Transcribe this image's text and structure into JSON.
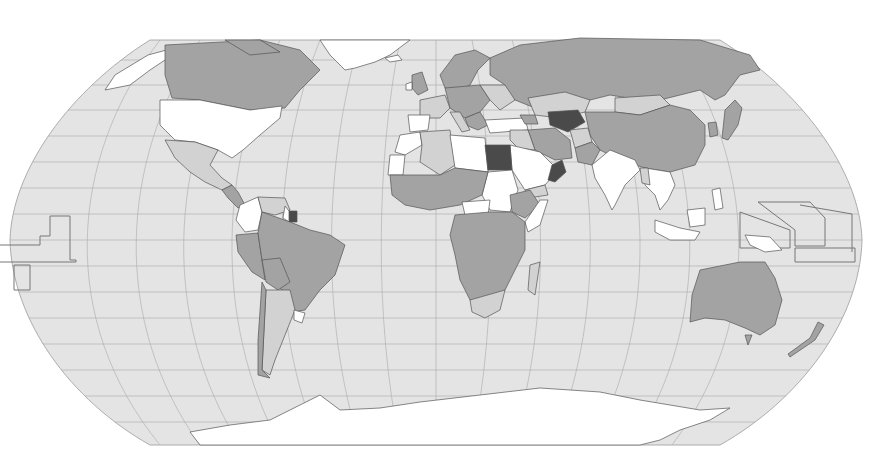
{
  "map": {
    "type": "choropleth",
    "projection": "Robinson",
    "labels_visible": false,
    "legend_visible": false,
    "colors": {
      "background": "#ffffff",
      "ocean": "#e4e4e4",
      "graticule": "#a9a9a9",
      "border": "#555555",
      "shade_none": "#ffffff",
      "shade_1": "#d2d2d2",
      "shade_2": "#a3a3a3",
      "shade_3": "#4a4a4a"
    },
    "regions": [
      {
        "name": "Canada",
        "shade": "shade_2"
      },
      {
        "name": "United States",
        "shade": "shade_none"
      },
      {
        "name": "Mexico",
        "shade": "shade_1"
      },
      {
        "name": "Greenland",
        "shade": "shade_none"
      },
      {
        "name": "Brazil",
        "shade": "shade_2"
      },
      {
        "name": "Argentina",
        "shade": "shade_1"
      },
      {
        "name": "Chile",
        "shade": "shade_2"
      },
      {
        "name": "Peru",
        "shade": "shade_2"
      },
      {
        "name": "Colombia",
        "shade": "shade_none"
      },
      {
        "name": "Venezuela",
        "shade": "shade_1"
      },
      {
        "name": "Suriname",
        "shade": "shade_3"
      },
      {
        "name": "Uruguay",
        "shade": "shade_none"
      },
      {
        "name": "Russia",
        "shade": "shade_2"
      },
      {
        "name": "China",
        "shade": "shade_2"
      },
      {
        "name": "Mongolia",
        "shade": "shade_1"
      },
      {
        "name": "Kazakhstan",
        "shade": "shade_1"
      },
      {
        "name": "Turkmenistan/Uzbekistan",
        "shade": "shade_3"
      },
      {
        "name": "India",
        "shade": "shade_none"
      },
      {
        "name": "Iran",
        "shade": "shade_2"
      },
      {
        "name": "Pakistan",
        "shade": "shade_2"
      },
      {
        "name": "Afghanistan",
        "shade": "shade_1"
      },
      {
        "name": "Saudi Arabia",
        "shade": "shade_none"
      },
      {
        "name": "Oman",
        "shade": "shade_3"
      },
      {
        "name": "Egypt",
        "shade": "shade_3"
      },
      {
        "name": "Libya",
        "shade": "shade_none"
      },
      {
        "name": "Algeria",
        "shade": "shade_1"
      },
      {
        "name": "Sudan",
        "shade": "shade_none"
      },
      {
        "name": "Ethiopia",
        "shade": "shade_2"
      },
      {
        "name": "Sub-Saharan Africa",
        "shade": "shade_2"
      },
      {
        "name": "South Africa",
        "shade": "shade_1"
      },
      {
        "name": "Madagascar",
        "shade": "shade_1"
      },
      {
        "name": "Europe (West)",
        "shade": "shade_1"
      },
      {
        "name": "Europe (Central)",
        "shade": "shade_2"
      },
      {
        "name": "Scandinavia",
        "shade": "shade_2"
      },
      {
        "name": "Turkey",
        "shade": "shade_none"
      },
      {
        "name": "Japan",
        "shade": "shade_2"
      },
      {
        "name": "Korea",
        "shade": "shade_2"
      },
      {
        "name": "Southeast Asia",
        "shade": "shade_none"
      },
      {
        "name": "Indonesia",
        "shade": "shade_none"
      },
      {
        "name": "Papua New Guinea",
        "shade": "shade_none"
      },
      {
        "name": "Australia",
        "shade": "shade_2"
      },
      {
        "name": "New Zealand",
        "shade": "shade_2"
      },
      {
        "name": "Antarctica",
        "shade": "shade_none"
      }
    ]
  }
}
